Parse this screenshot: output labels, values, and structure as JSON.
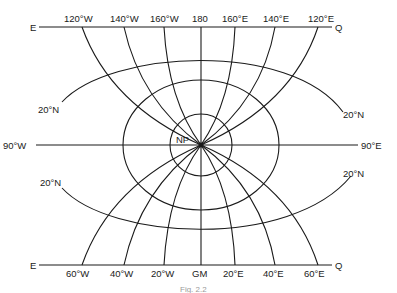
{
  "figure": {
    "caption": "Fig. 2.2",
    "pole_label": "NP",
    "top_line": {
      "left_end": "E",
      "right_end": "Q"
    },
    "bottom_line": {
      "left_end": "E",
      "right_end": "Q"
    },
    "top_meridian_labels": [
      "120°W",
      "140°W",
      "160°W",
      "180",
      "160°E",
      "140°E",
      "120°E"
    ],
    "bottom_meridian_labels": [
      "60°W",
      "40°W",
      "20°W",
      "GM",
      "20°E",
      "40°E",
      "60°E"
    ],
    "horizontal_axis": {
      "left": "90°W",
      "right": "90°E"
    },
    "parallel_labels": {
      "upper_left": "20°N",
      "upper_right": "20°N",
      "lower_left": "20°N",
      "lower_right": "20°N"
    }
  }
}
